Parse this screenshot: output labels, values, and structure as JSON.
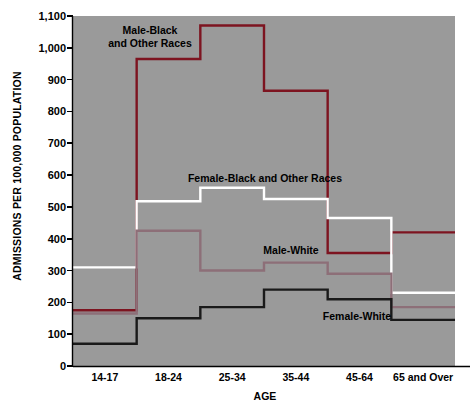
{
  "chart_data": {
    "type": "line",
    "subtype": "step",
    "title": "",
    "xlabel": "AGE",
    "ylabel": "ADMISSIONS PER 100,000 POPULATION",
    "categories": [
      "14-17",
      "18-24",
      "25-34",
      "35-44",
      "45-64",
      "65 and Over"
    ],
    "ylim": [
      0,
      1100
    ],
    "ytick_values": [
      0,
      100,
      200,
      300,
      400,
      500,
      600,
      700,
      800,
      900,
      1000,
      1100
    ],
    "ytick_labels": [
      "0",
      "100",
      "200",
      "300",
      "400",
      "500",
      "600",
      "700",
      "800",
      "900",
      "1,000",
      "1,100"
    ],
    "grid": false,
    "plot_background": "#9a9a9a",
    "legend_position": "inline-annotations",
    "series": [
      {
        "name": "Male-Black and Other Races",
        "color": "#7d1420",
        "label_lines": [
          "Male-Black",
          "and Other Races"
        ],
        "values": [
          175,
          965,
          1070,
          865,
          355,
          420
        ]
      },
      {
        "name": "Female-Black and Other Races",
        "color": "#ffffff",
        "label_lines": [
          "Female-Black and Other Races"
        ],
        "values": [
          310,
          518,
          560,
          525,
          465,
          230
        ]
      },
      {
        "name": "Male-White",
        "color": "#8d6f78",
        "label_lines": [
          "Male-White"
        ],
        "values": [
          165,
          425,
          300,
          325,
          290,
          185
        ]
      },
      {
        "name": "Female-White",
        "color": "#1a1a1a",
        "label_lines": [
          "Female-White"
        ],
        "values": [
          70,
          150,
          185,
          240,
          210,
          145
        ]
      }
    ]
  },
  "annotations": [
    {
      "id": "male-black",
      "text_lines": [
        "Male-Black",
        "and Other Races"
      ],
      "x": 150,
      "y": 24
    },
    {
      "id": "female-black",
      "text_lines": [
        "Female-Black and Other Races"
      ],
      "x": 265,
      "y": 172
    },
    {
      "id": "male-white",
      "text_lines": [
        "Male-White"
      ],
      "x": 291,
      "y": 244
    },
    {
      "id": "female-white",
      "text_lines": [
        "Female-White"
      ],
      "x": 357,
      "y": 310
    }
  ],
  "axes": {
    "x_title": "AGE",
    "y_title": "ADMISSIONS PER 100,000 POPULATION"
  }
}
